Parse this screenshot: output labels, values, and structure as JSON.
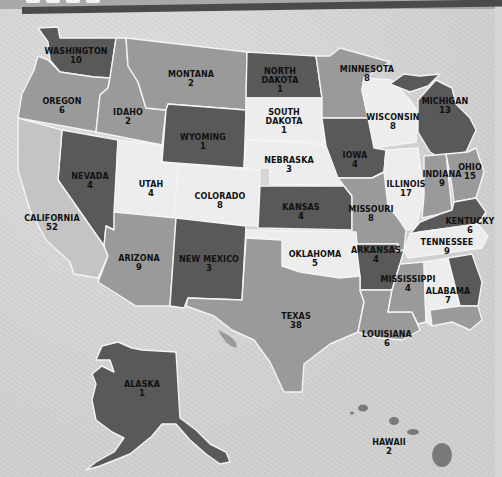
{
  "title_banner": {
    "text": "",
    "note": "cropped banner, text not legible"
  },
  "colors": {
    "light": "#ededed",
    "light_mid": "#c4c4c4",
    "mid": "#9a9a9a",
    "mid_dark": "#7d7d7d",
    "dark": "#595959",
    "border": "#f4f4f4",
    "background": "#d6d6d6"
  },
  "states": [
    {
      "name": "WASHINGTON",
      "value": "10"
    },
    {
      "name": "OREGON",
      "value": "6"
    },
    {
      "name": "IDAHO",
      "value": "2"
    },
    {
      "name": "MONTANA",
      "value": "2"
    },
    {
      "name": "NORTH DAKOTA",
      "value": "1"
    },
    {
      "name": "MINNESOTA",
      "value": "8"
    },
    {
      "name": "SOUTH DAKOTA",
      "value": "1"
    },
    {
      "name": "WYOMING",
      "value": "1"
    },
    {
      "name": "WISCONSIN",
      "value": "8"
    },
    {
      "name": "MICHIGAN",
      "value": "13"
    },
    {
      "name": "NEBRASKA",
      "value": "3"
    },
    {
      "name": "IOWA",
      "value": "4"
    },
    {
      "name": "NEVADA",
      "value": "4"
    },
    {
      "name": "UTAH",
      "value": "4"
    },
    {
      "name": "COLORADO",
      "value": "8"
    },
    {
      "name": "ILLINOIS",
      "value": "17"
    },
    {
      "name": "INDIANA",
      "value": "9"
    },
    {
      "name": "OHIO",
      "value": "15"
    },
    {
      "name": "CALIFORNIA",
      "value": "52"
    },
    {
      "name": "KANSAS",
      "value": "4"
    },
    {
      "name": "MISSOURI",
      "value": "8"
    },
    {
      "name": "KENTUCKY",
      "value": "6"
    },
    {
      "name": "TENNESSEE",
      "value": "9"
    },
    {
      "name": "ARIZONA",
      "value": "9"
    },
    {
      "name": "NEW MEXICO",
      "value": "3"
    },
    {
      "name": "OKLAHOMA",
      "value": "5"
    },
    {
      "name": "ARKANSAS",
      "value": "4"
    },
    {
      "name": "MISSISSIPPI",
      "value": "4"
    },
    {
      "name": "ALABAMA",
      "value": "7"
    },
    {
      "name": "TEXAS",
      "value": "38"
    },
    {
      "name": "LOUISIANA",
      "value": "6"
    },
    {
      "name": "ALASKA",
      "value": "1"
    },
    {
      "name": "HAWAII",
      "value": "2"
    }
  ]
}
